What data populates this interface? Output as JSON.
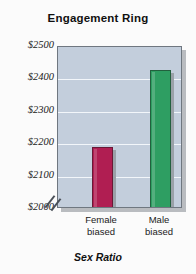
{
  "chart_data": {
    "type": "bar",
    "title": "Engagement Ring",
    "xlabel": "Sex Ratio",
    "ylabel": "",
    "categories": [
      "Female biased",
      "Male biased"
    ],
    "category_lines": [
      [
        "Female",
        "biased"
      ],
      [
        "Male",
        "biased"
      ]
    ],
    "values": [
      2190,
      2430
    ],
    "value_labels": [
      "$2190",
      "$2430"
    ],
    "ylim": [
      2000,
      2500
    ],
    "yticks": [
      2000,
      2100,
      2200,
      2300,
      2400,
      2500
    ],
    "ytick_labels": [
      "$2000",
      "$2100",
      "$2200",
      "$2300",
      "$2400",
      "$2500"
    ],
    "axis_break": true,
    "axis_break_note": "y-axis broken below $2000",
    "grid": true,
    "grid_color": "#f2f6fa",
    "plot_background": "#c3cedc",
    "legend": null,
    "bar_colors": [
      "#b01e52",
      "#2e9e62"
    ],
    "series": [
      {
        "name": "Engagement Ring Price",
        "values": [
          2190,
          2430
        ],
        "colors": [
          "#b01e52",
          "#2e9e62"
        ]
      }
    ]
  },
  "figure": {
    "background": "#fbfbfb",
    "border_color": "#6f7780",
    "shadow_color": "#b9bcc0"
  }
}
